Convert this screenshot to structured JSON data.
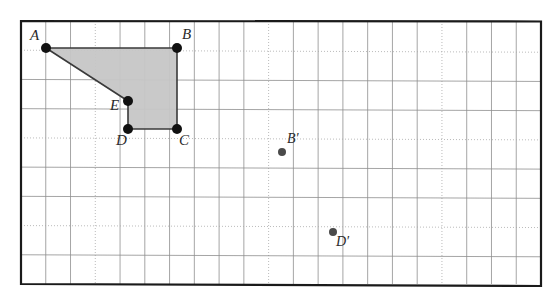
{
  "figure": {
    "type": "geometry-diagram",
    "frame": {
      "left": 21,
      "top": 21,
      "right": 541,
      "bottom": 284,
      "border_color": "#1a1a1a",
      "border_width": 2.2
    },
    "grid": {
      "columns": 21,
      "rows": 9,
      "cell_width": 24.8,
      "cell_height": 29.2,
      "solid_line_color": "#8e8e8e",
      "dotted_line_color": "#a8a8a8",
      "dotted_row_indices": [
        1,
        4,
        7
      ],
      "dotted_col_indices": [
        3,
        10,
        17
      ],
      "line_width": 0.8
    },
    "shape": {
      "name": "ABCDE",
      "fill_color": "#c6c6c6",
      "fill_opacity": 0.95,
      "stroke_color": "#3a3a3a",
      "stroke_width": 1.6,
      "vertices_path": "A,B,C,D,E"
    },
    "points": [
      {
        "id": "A",
        "label": "A",
        "x": 46,
        "y": 48,
        "radius": 5.0,
        "color": "#111111",
        "label_dx": -16,
        "label_dy": -20,
        "primed": false
      },
      {
        "id": "B",
        "label": "B",
        "x": 177,
        "y": 48,
        "radius": 5.0,
        "color": "#111111",
        "label_dx": 5,
        "label_dy": -21,
        "primed": false
      },
      {
        "id": "C",
        "label": "C",
        "x": 177,
        "y": 129,
        "radius": 5.0,
        "color": "#111111",
        "label_dx": 2,
        "label_dy": 4,
        "primed": false
      },
      {
        "id": "D",
        "label": "D",
        "x": 128,
        "y": 129,
        "radius": 5.0,
        "color": "#111111",
        "label_dx": -12,
        "label_dy": 4,
        "primed": false
      },
      {
        "id": "E",
        "label": "E",
        "x": 128,
        "y": 101,
        "radius": 5.0,
        "color": "#111111",
        "label_dx": -18,
        "label_dy": -3,
        "primed": false
      },
      {
        "id": "Bp",
        "label": "B′",
        "x": 282,
        "y": 152,
        "radius": 4.0,
        "color": "#4a4a4a",
        "label_dx": 5,
        "label_dy": -20,
        "primed": true
      },
      {
        "id": "Dp",
        "label": "D′",
        "x": 333,
        "y": 232,
        "radius": 4.0,
        "color": "#4a4a4a",
        "label_dx": 3,
        "label_dy": 3,
        "primed": true
      }
    ],
    "edges": [
      {
        "from": "A",
        "to": "B"
      },
      {
        "from": "B",
        "to": "C"
      },
      {
        "from": "C",
        "to": "D"
      },
      {
        "from": "D",
        "to": "E"
      },
      {
        "from": "E",
        "to": "A"
      }
    ],
    "page": {
      "background": "#ffffff",
      "width": 558,
      "height": 305
    }
  }
}
